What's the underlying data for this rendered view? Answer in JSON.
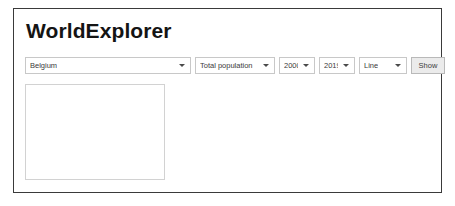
{
  "window": {
    "title": "WorldExplorer"
  },
  "controls": {
    "country_select": {
      "name": "country-select",
      "value": "Belgium",
      "caret_icon": "chevron-down-icon"
    },
    "indicator_select": {
      "name": "indicator-select",
      "value": "Total population",
      "caret_icon": "chevron-down-icon"
    },
    "year_from_select": {
      "name": "year-from-select",
      "value": "2000",
      "caret_icon": "chevron-down-icon"
    },
    "year_to_select": {
      "name": "year-to-select",
      "value": "2019",
      "caret_icon": "chevron-down-icon"
    },
    "chart_type_select": {
      "name": "chart-type-select",
      "value": "Line",
      "caret_icon": "chevron-down-icon"
    },
    "show_button": {
      "name": "show-button",
      "label": "Show"
    }
  },
  "chart_area": {
    "placeholder_text": ""
  },
  "colors": {
    "window_border": "#3a3a3a",
    "control_border": "#c8c8c8",
    "button_background": "#ebebeb",
    "button_border": "#b9b9b9",
    "chart_border": "#d2d2d2",
    "text": "#3b3b3b",
    "title_text": "#141414",
    "page_background": "#ffffff"
  }
}
